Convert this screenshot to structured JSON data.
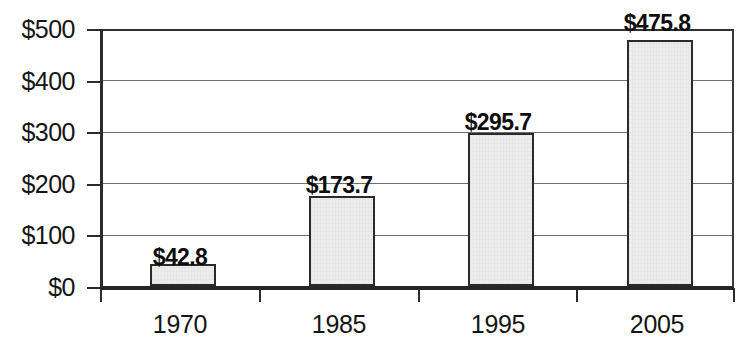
{
  "chart_data": {
    "type": "bar",
    "title": "",
    "subtitle": "",
    "xlabel": "",
    "ylabel": "",
    "categories": [
      "1970",
      "1985",
      "1995",
      "2005"
    ],
    "values": [
      42.8,
      173.7,
      295.7,
      475.8
    ],
    "value_labels": [
      "$42.8",
      "$173.7",
      "$295.7",
      "$475.8"
    ],
    "ylim": [
      0,
      500
    ],
    "ytick_values": [
      0,
      100,
      200,
      300,
      400,
      500
    ],
    "ytick_labels": [
      "$0",
      "$100",
      "$200",
      "$300",
      "$400",
      "$500"
    ],
    "grid": true,
    "grid_axis": "y",
    "legend": false,
    "legend_position": "none",
    "series": [
      {
        "name": "",
        "values": [
          42.8,
          173.7,
          295.7,
          475.8
        ]
      }
    ],
    "colors": {
      "bar_fill": "#ececec",
      "bar_border": "#2a2a2a",
      "grid": "#4a4a4a",
      "axis": "#262626",
      "text": "#151515",
      "background": "#ffffff"
    }
  }
}
